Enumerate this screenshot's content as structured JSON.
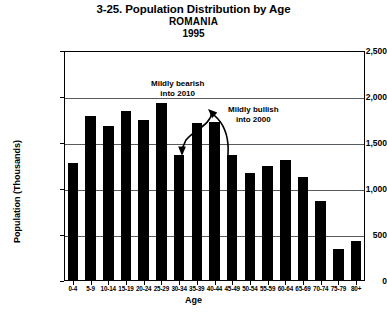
{
  "chart_data": {
    "type": "bar",
    "title": "3-25. Population Distribution by Age",
    "subtitle": "ROMANIA",
    "year_label": "1995",
    "xlabel": "Age",
    "ylabel": "Population (Thousands)",
    "categories": [
      "0-4",
      "5-9",
      "10-14",
      "15-19",
      "20-24",
      "25-29",
      "30-34",
      "35-39",
      "40-44",
      "45-49",
      "50-54",
      "55-59",
      "60-64",
      "65-69",
      "70-74",
      "75-79",
      "80+"
    ],
    "values": [
      1280,
      1790,
      1680,
      1845,
      1755,
      1935,
      1365,
      1720,
      1730,
      1370,
      1170,
      1250,
      1320,
      1130,
      865,
      350,
      440
    ],
    "ylim": [
      0,
      2500
    ],
    "yticks": [
      0,
      500,
      1000,
      1500,
      2000,
      2500
    ],
    "ytick_labels": [
      "0",
      "500",
      "1,000",
      "1,500",
      "2,000",
      "2,500"
    ],
    "grid": true,
    "grid_axis": "y",
    "legend": false,
    "bar_color": "#000000",
    "annotations": [
      {
        "id": "mildly-bearish",
        "line1": "Mildly bearish",
        "line2": "into 2010",
        "arrow": "curved-arrow-down-left",
        "points_to": "30-34"
      },
      {
        "id": "mildly-bullish",
        "line1": "Mildly bullish",
        "line2": "into 2000",
        "arrow": "curved-arrow-up-left",
        "points_to": "40-44"
      }
    ]
  }
}
